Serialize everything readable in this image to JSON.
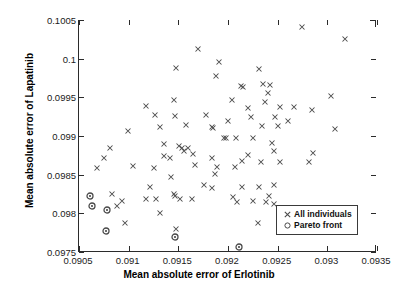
{
  "chart_data": {
    "type": "scatter",
    "title": "",
    "xlabel": "Mean absolute error of Erlotinib",
    "ylabel": "Mean absolute error of Lapatinib",
    "xlim": [
      0.0905,
      0.0935
    ],
    "ylim": [
      0.0975,
      0.1005
    ],
    "xticks": [
      0.0905,
      0.091,
      0.0915,
      0.092,
      0.0925,
      0.093,
      0.0935
    ],
    "xticklabels": [
      "0.0905",
      "0.091",
      "0.0915",
      "0.092",
      "0.0925",
      "0.093",
      "0.0935"
    ],
    "yticks": [
      0.0975,
      0.098,
      0.0985,
      0.099,
      0.0995,
      0.1,
      0.1005
    ],
    "yticklabels": [
      "0.0975",
      "0.098",
      "0.0985",
      "0.099",
      "0.0995",
      "0.1",
      "0.1005"
    ],
    "grid": false,
    "legend_position": "lower right",
    "marker_color": "#4a4a4a",
    "axis_color": "#2b2b2b",
    "series": [
      {
        "name": "All individuals",
        "marker": "x",
        "points": [
          [
            0.09275,
            0.10041
          ],
          [
            0.09319,
            0.10026
          ],
          [
            0.09171,
            0.10013
          ],
          [
            0.09192,
            0.09996
          ],
          [
            0.09149,
            0.09988
          ],
          [
            0.09232,
            0.09986
          ],
          [
            0.09189,
            0.09977
          ],
          [
            0.09236,
            0.09967
          ],
          [
            0.09243,
            0.09966
          ],
          [
            0.09214,
            0.09965
          ],
          [
            0.09216,
            0.09963
          ],
          [
            0.09241,
            0.09956
          ],
          [
            0.09305,
            0.09952
          ],
          [
            0.09147,
            0.09947
          ],
          [
            0.09238,
            0.09944
          ],
          [
            0.09118,
            0.09939
          ],
          [
            0.09221,
            0.09936
          ],
          [
            0.09205,
            0.09947
          ],
          [
            0.09253,
            0.09938
          ],
          [
            0.09267,
            0.09938
          ],
          [
            0.09286,
            0.09933
          ],
          [
            0.09128,
            0.09927
          ],
          [
            0.09148,
            0.09926
          ],
          [
            0.09179,
            0.09927
          ],
          [
            0.09224,
            0.09925
          ],
          [
            0.09248,
            0.09925
          ],
          [
            0.09201,
            0.09919
          ],
          [
            0.09261,
            0.09919
          ],
          [
            0.09235,
            0.09913
          ],
          [
            0.09251,
            0.09913
          ],
          [
            0.09159,
            0.09914
          ],
          [
            0.09133,
            0.09912
          ],
          [
            0.09309,
            0.09909
          ],
          [
            0.09185,
            0.09911
          ],
          [
            0.09186,
            0.0991
          ],
          [
            0.091,
            0.09907
          ],
          [
            0.09197,
            0.09898
          ],
          [
            0.09199,
            0.09897
          ],
          [
            0.09209,
            0.09897
          ],
          [
            0.09226,
            0.09897
          ],
          [
            0.09245,
            0.09891
          ],
          [
            0.09137,
            0.0989
          ],
          [
            0.09152,
            0.09887
          ],
          [
            0.09155,
            0.09885
          ],
          [
            0.09082,
            0.09885
          ],
          [
            0.09161,
            0.09884
          ],
          [
            0.09157,
            0.0988
          ],
          [
            0.09287,
            0.09878
          ],
          [
            0.09247,
            0.0988
          ],
          [
            0.09221,
            0.09875
          ],
          [
            0.09166,
            0.09877
          ],
          [
            0.09137,
            0.09874
          ],
          [
            0.09076,
            0.09872
          ],
          [
            0.09185,
            0.09872
          ],
          [
            0.09215,
            0.09868
          ],
          [
            0.09253,
            0.09867
          ],
          [
            0.09283,
            0.09867
          ],
          [
            0.09143,
            0.09871
          ],
          [
            0.09234,
            0.09866
          ],
          [
            0.09105,
            0.09861
          ],
          [
            0.09168,
            0.09862
          ],
          [
            0.09208,
            0.0986
          ],
          [
            0.0919,
            0.0986
          ],
          [
            0.09069,
            0.09858
          ],
          [
            0.09127,
            0.09858
          ],
          [
            0.09188,
            0.09851
          ],
          [
            0.09144,
            0.09847
          ],
          [
            0.09177,
            0.09837
          ],
          [
            0.09215,
            0.09834
          ],
          [
            0.09232,
            0.09834
          ],
          [
            0.09247,
            0.09836
          ],
          [
            0.09185,
            0.09833
          ],
          [
            0.09122,
            0.09834
          ],
          [
            0.09206,
            0.09821
          ],
          [
            0.09147,
            0.09825
          ],
          [
            0.09148,
            0.09823
          ],
          [
            0.09084,
            0.09825
          ],
          [
            0.09129,
            0.09819
          ],
          [
            0.09153,
            0.09819
          ],
          [
            0.09165,
            0.09819
          ],
          [
            0.09094,
            0.09816
          ],
          [
            0.09226,
            0.09816
          ],
          [
            0.09239,
            0.09815
          ],
          [
            0.0921,
            0.09815
          ],
          [
            0.09242,
            0.09822
          ],
          [
            0.09089,
            0.0981
          ],
          [
            0.09118,
            0.09819
          ],
          [
            0.09247,
            0.09812
          ],
          [
            0.09133,
            0.09801
          ],
          [
            0.09097,
            0.09787
          ],
          [
            0.09231,
            0.09787
          ],
          [
            0.09149,
            0.0978
          ]
        ]
      },
      {
        "name": "Pareto front",
        "marker": "o",
        "points": [
          [
            0.09062,
            0.09822
          ],
          [
            0.09064,
            0.09809
          ],
          [
            0.09079,
            0.09804
          ],
          [
            0.09078,
            0.09777
          ],
          [
            0.09148,
            0.0977
          ],
          [
            0.09212,
            0.09756
          ]
        ]
      }
    ]
  },
  "legend": {
    "items": [
      {
        "label": "All individuals",
        "marker": "x"
      },
      {
        "label": "Pareto front",
        "marker": "o"
      }
    ]
  }
}
